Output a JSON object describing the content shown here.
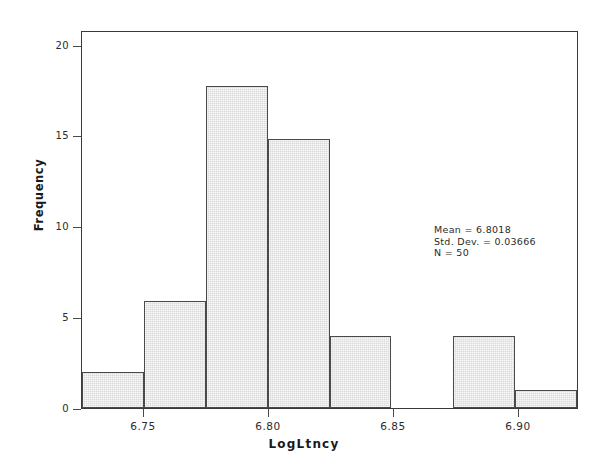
{
  "chart_data": {
    "type": "bar",
    "title": "",
    "subtitle": "",
    "xlabel": "LogLtncy",
    "ylabel": "Frequency",
    "xlim": [
      6.7225,
      6.9225
    ],
    "ylim": [
      0,
      21
    ],
    "grid": false,
    "legend": null,
    "bin_width": 0.025,
    "categories": [
      "6.7225-6.7475",
      "6.7475-6.7725",
      "6.7725-6.7975",
      "6.7975-6.8225",
      "6.8225-6.8475",
      "6.8475-6.8725",
      "6.8725-6.8975",
      "6.8975-6.9225"
    ],
    "bin_edges": [
      6.7225,
      6.7475,
      6.7725,
      6.7975,
      6.8225,
      6.8475,
      6.8725,
      6.8975,
      6.9225
    ],
    "values": [
      2,
      6,
      18,
      15,
      4,
      0,
      4,
      1
    ],
    "xticks": [
      6.75,
      6.8,
      6.85,
      6.9
    ],
    "xtick_labels": [
      "6.75",
      "6.80",
      "6.85",
      "6.90"
    ],
    "yticks": [
      0,
      5,
      10,
      15,
      20
    ],
    "ytick_labels": [
      "0",
      "5",
      "10",
      "15",
      "20"
    ],
    "annotations": [
      "Mean = 6.8018",
      "Std. Dev. = 0.03666",
      "N = 50"
    ]
  },
  "stats": {
    "mean_line": "Mean = 6.8018",
    "stddev_line": "Std. Dev. = 0.03666",
    "n_line": "N = 50"
  },
  "axis": {
    "x_title": "LogLtncy",
    "y_title": "Frequency"
  },
  "colors": {
    "bar_fill": "#d9d9d9",
    "bar_border": "#4a4a4a",
    "frame": "#3a3a3a",
    "text": "#2b2b2b",
    "background": "#ffffff"
  }
}
